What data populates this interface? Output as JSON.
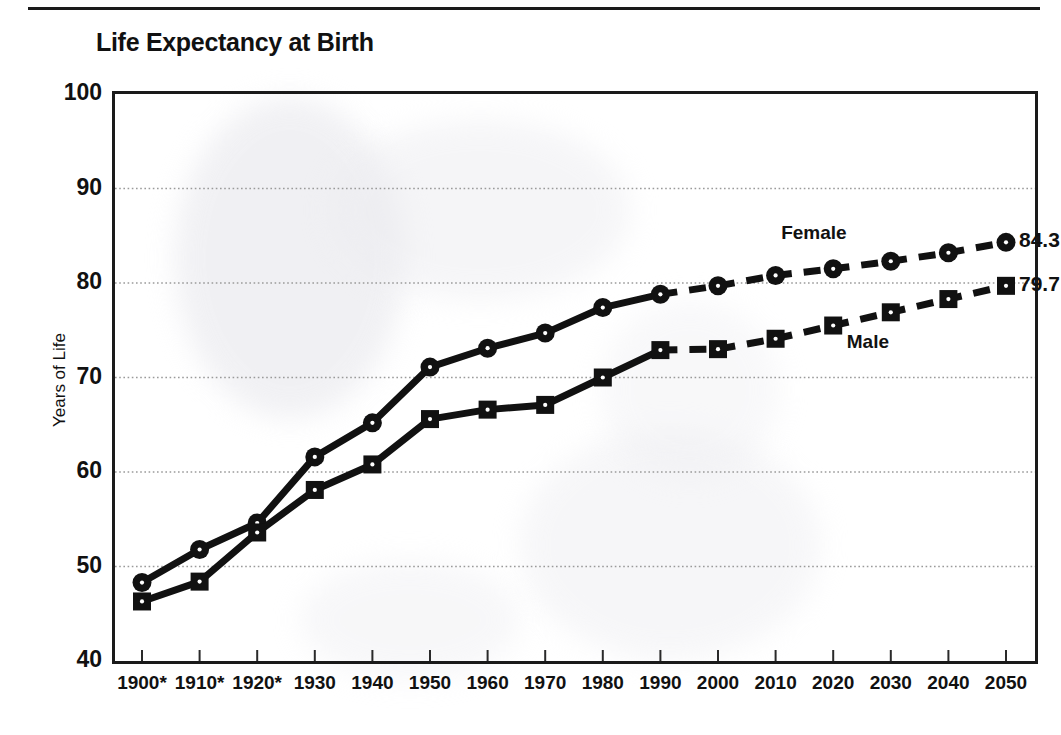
{
  "chart_data": {
    "type": "line",
    "title": "Life Expectancy at Birth",
    "xlabel": "",
    "ylabel": "Years of Life",
    "ylim": [
      40,
      100
    ],
    "yticks": [
      40,
      50,
      60,
      70,
      80,
      90,
      100
    ],
    "grid": true,
    "legend_position": "inline-annotation",
    "categories": [
      "1900*",
      "1910*",
      "1920*",
      "1930",
      "1940",
      "1950",
      "1960",
      "1970",
      "1980",
      "1990",
      "2000",
      "2010",
      "2020",
      "2030",
      "2040",
      "2050"
    ],
    "x": [
      1900,
      1910,
      1920,
      1930,
      1940,
      1950,
      1960,
      1970,
      1980,
      1990,
      2000,
      2010,
      2020,
      2030,
      2040,
      2050
    ],
    "projection_starts_after": 1990,
    "series": [
      {
        "name": "Female",
        "marker": "circle",
        "color": "#111111",
        "end_label": "84.3",
        "values": [
          48.3,
          51.8,
          54.6,
          61.6,
          65.2,
          71.1,
          73.1,
          74.7,
          77.4,
          78.8,
          79.7,
          80.8,
          81.5,
          82.3,
          83.2,
          84.3
        ]
      },
      {
        "name": "Male",
        "marker": "square",
        "color": "#111111",
        "end_label": "79.7",
        "values": [
          46.3,
          48.4,
          53.6,
          58.1,
          60.8,
          65.6,
          66.6,
          67.1,
          70.0,
          72.9,
          73.0,
          74.1,
          75.5,
          76.9,
          78.3,
          79.7
        ]
      }
    ]
  },
  "axis": {
    "y_title": "Years of Life",
    "y_tick_labels": [
      "100",
      "90",
      "80",
      "70",
      "60",
      "50",
      "40"
    ],
    "x_tick_labels": [
      "1900*",
      "1910*",
      "1920*",
      "1930",
      "1940",
      "1950",
      "1960",
      "1970",
      "1980",
      "1990",
      "2000",
      "2010",
      "2020",
      "2030",
      "2040",
      "2050"
    ]
  },
  "annotations": {
    "female_label": "Female",
    "male_label": "Male",
    "female_end_value": "84.3",
    "male_end_value": "79.7"
  }
}
